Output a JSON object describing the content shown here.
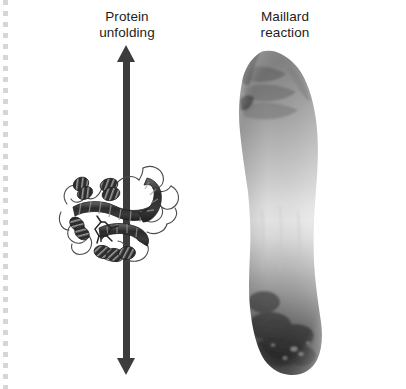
{
  "figure": {
    "background_color": "#ffffff",
    "width": 406,
    "height": 389
  },
  "panels": {
    "left": {
      "caption": "Protein\nunfolding",
      "subject": "protein-ribbon-diagram",
      "subject_description": "globular protein tertiary structure rendered as ribbon cartoon with alpha helices and connecting loops",
      "annotation": "double-headed vertical arrow"
    },
    "right": {
      "caption": "Maillard\nreaction",
      "subject": "browned-food-photograph",
      "subject_description": "grayscale photograph of an elongated baked food item shading from light at the top-middle to dark brown-black crust at the bottom"
    }
  },
  "arrow": {
    "name": "double-headed-vertical-arrow",
    "color": "#3c3c3c",
    "direction": "both",
    "shaft_width_px": 7,
    "top_tip_y": 45,
    "bottom_tip_y": 375
  },
  "colors": {
    "ink": "#1c1c1c",
    "arrow": "#3c3c3c",
    "ribbon_dark": "#2e2e2e",
    "ribbon_outline": "#555555",
    "crust_dark": "#1a1a1a",
    "crust_mid": "#8a8a8a",
    "crust_light": "#fbfbfb",
    "scan_edge": "#d6d6d6",
    "background": "#ffffff"
  },
  "artifacts": {
    "left_dashed_scan_edge": {
      "name": "scan-edge-dashes",
      "color": "#d6d6d6",
      "dash_length_px": 5,
      "gap_length_px": 6
    }
  }
}
